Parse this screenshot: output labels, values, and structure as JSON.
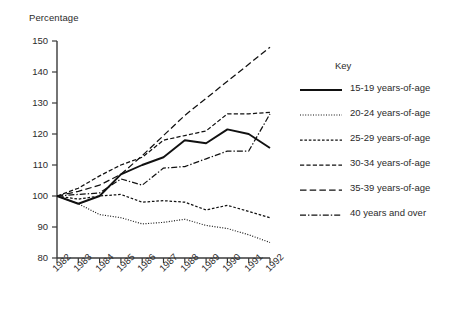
{
  "chart_data": {
    "type": "line",
    "title": "",
    "ylabel": "Percentage",
    "xlabel": "",
    "grid": false,
    "legend_position": "right",
    "legend_title": "Key",
    "ylim": [
      80,
      150
    ],
    "yticks": [
      80,
      90,
      100,
      110,
      120,
      130,
      140,
      150
    ],
    "categories": [
      "1982",
      "1983",
      "1984",
      "1985",
      "1986",
      "1987",
      "1988",
      "1989",
      "1990",
      "1991",
      "1992"
    ],
    "x": [
      1982,
      1983,
      1984,
      1985,
      1986,
      1987,
      1988,
      1989,
      1990,
      1991,
      1992
    ],
    "series": [
      {
        "name": "15-19 years-of-age",
        "style": "solid",
        "values": [
          100,
          97.5,
          100,
          107,
          110,
          112.5,
          118,
          117,
          121.5,
          120,
          115.5
        ]
      },
      {
        "name": "20-24 years-of-age",
        "style": "dotted",
        "values": [
          100,
          97.5,
          94,
          93,
          91,
          91.5,
          92.5,
          90.5,
          89.5,
          87.5,
          85
        ]
      },
      {
        "name": "25-29 years-of-age",
        "style": "dashed-small",
        "values": [
          100,
          99,
          100,
          100.5,
          98,
          98.5,
          98,
          95.5,
          97,
          95,
          93
        ]
      },
      {
        "name": "30-34 years-of-age",
        "style": "dashed-medium",
        "values": [
          100,
          102.5,
          106.5,
          110,
          112.5,
          118,
          119.5,
          121,
          126.5,
          126.5,
          127
        ]
      },
      {
        "name": "35-39 years-of-age",
        "style": "dashed-long",
        "values": [
          100,
          101.5,
          103.5,
          107,
          113,
          119.5,
          126,
          131.5,
          137,
          142.5,
          148
        ]
      },
      {
        "name": "40 years and over",
        "style": "dash-dot",
        "values": [
          100,
          100.5,
          101,
          105.5,
          103.5,
          109,
          109.5,
          112,
          114.5,
          114.5,
          126.5
        ]
      }
    ]
  }
}
